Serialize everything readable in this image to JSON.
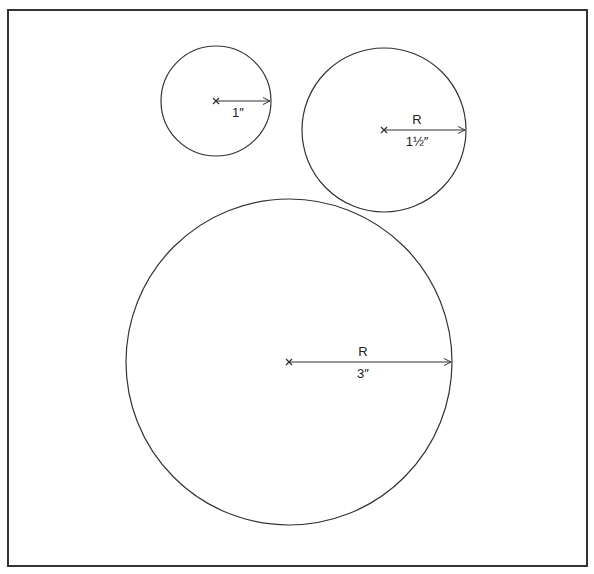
{
  "diagram": {
    "frame": {
      "x": 8,
      "y": 10,
      "width": 579,
      "height": 556,
      "stroke": "#333333"
    },
    "stroke_color": "#333333",
    "circles": [
      {
        "id": "small",
        "cx": 216,
        "cy": 101,
        "r": 55,
        "radius_top_label": "",
        "radius_bottom_label": "1″"
      },
      {
        "id": "medium",
        "cx": 384,
        "cy": 130,
        "r": 82,
        "radius_top_label": "R",
        "radius_bottom_label": "1½″"
      },
      {
        "id": "large",
        "cx": 289,
        "cy": 362,
        "r": 163,
        "radius_top_label": "R",
        "radius_bottom_label": "3″"
      }
    ]
  }
}
